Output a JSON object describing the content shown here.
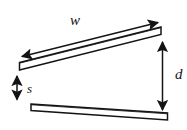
{
  "figure": {
    "type": "geometry-diagram",
    "background_color": "#ffffff",
    "stroke_color": "#141414",
    "plate_fill_color": "#ffffff",
    "labels": {
      "width": "w",
      "distance": "d",
      "separation": "s"
    },
    "label_list": [
      {
        "text": "w",
        "name": "width-label",
        "meaning": "plate width / length along the plate"
      },
      {
        "text": "d",
        "name": "distance-label",
        "meaning": "vertical gap at the right end"
      },
      {
        "text": "s",
        "name": "separation-label",
        "meaning": "vertical gap at the left end"
      }
    ],
    "elements": [
      {
        "name": "top-plate",
        "kind": "plate",
        "orientation": "tilted-up-to-the-right"
      },
      {
        "name": "bottom-plate",
        "kind": "plate",
        "orientation": "nearly-horizontal"
      },
      {
        "name": "width-dimension-arrow",
        "kind": "double-headed-arrow",
        "direction": "along-top-plate"
      },
      {
        "name": "distance-dimension-arrow",
        "kind": "double-headed-arrow",
        "direction": "vertical"
      },
      {
        "name": "separation-dimension-arrow",
        "kind": "double-headed-arrow",
        "direction": "vertical"
      }
    ]
  }
}
